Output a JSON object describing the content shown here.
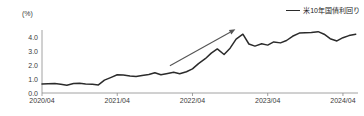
{
  "chart_data": {
    "type": "line",
    "title": "",
    "subtitle": "",
    "unit_label": "(%)",
    "xlabel": "",
    "ylabel": "",
    "ylim": [
      0.0,
      4.5
    ],
    "yticks": [
      "0.0",
      "1.0",
      "2.0",
      "3.0",
      "4.0"
    ],
    "ytick_values": [
      0.0,
      1.0,
      2.0,
      3.0,
      4.0
    ],
    "xticks": [
      "2020/04",
      "2021/04",
      "2022/04",
      "2023/04",
      "2024/04"
    ],
    "xtick_values": [
      2020.25,
      2021.25,
      2022.25,
      2023.25,
      2024.25
    ],
    "xlim": [
      2020.25,
      2024.45
    ],
    "grid": false,
    "legend_position": "top-right",
    "legend": [
      "米10年国債利回り"
    ],
    "series": [
      {
        "name": "米10年国債利回り",
        "color": "#2b2b2b",
        "x": [
          2020.25,
          2020.33,
          2020.42,
          2020.5,
          2020.58,
          2020.67,
          2020.75,
          2020.83,
          2020.92,
          2021.0,
          2021.08,
          2021.17,
          2021.25,
          2021.33,
          2021.42,
          2021.5,
          2021.58,
          2021.67,
          2021.75,
          2021.83,
          2021.92,
          2022.0,
          2022.08,
          2022.17,
          2022.25,
          2022.33,
          2022.42,
          2022.5,
          2022.58,
          2022.67,
          2022.75,
          2022.83,
          2022.92,
          2023.0,
          2023.08,
          2023.17,
          2023.25,
          2023.33,
          2023.42,
          2023.5,
          2023.58,
          2023.67,
          2023.75,
          2023.83,
          2023.92,
          2024.0,
          2024.08,
          2024.17,
          2024.25,
          2024.33,
          2024.42
        ],
        "y": [
          0.64,
          0.66,
          0.68,
          0.62,
          0.55,
          0.68,
          0.7,
          0.65,
          0.62,
          0.58,
          0.92,
          1.12,
          1.3,
          1.28,
          1.22,
          1.18,
          1.25,
          1.32,
          1.45,
          1.3,
          1.4,
          1.48,
          1.38,
          1.52,
          1.72,
          2.1,
          2.45,
          2.85,
          3.15,
          2.75,
          3.2,
          3.85,
          4.2,
          3.5,
          3.35,
          3.52,
          3.42,
          3.65,
          3.58,
          3.75,
          4.05,
          4.28,
          4.3,
          4.32,
          4.38,
          4.2,
          3.88,
          3.72,
          3.95,
          4.1,
          4.2
        ]
      }
    ],
    "annotations": [
      {
        "type": "arrow",
        "label": "",
        "from": [
          2021.95,
          1.95
        ],
        "to": [
          2022.82,
          4.55
        ],
        "color": "#555555"
      }
    ]
  }
}
